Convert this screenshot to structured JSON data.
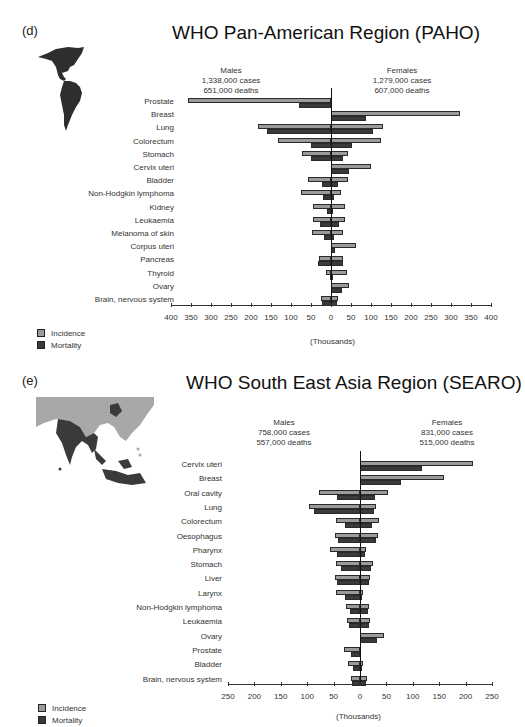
{
  "panels": [
    {
      "letter": "(d)",
      "title": "WHO Pan-American Region (PAHO)",
      "males": {
        "label": "Males",
        "cases": "1,338,000 cases",
        "deaths": "651,000 deaths"
      },
      "females": {
        "label": "Females",
        "cases": "1,279,000 cases",
        "deaths": "607,000 deaths"
      },
      "axis_title": "(Thousands)",
      "tick_labels": [
        "400",
        "350",
        "300",
        "250",
        "200",
        "150",
        "100",
        "50",
        "0",
        "50",
        "100",
        "150",
        "200",
        "250",
        "300",
        "350",
        "400"
      ],
      "legend": {
        "incidence": "Incidence",
        "mortality": "Mortality"
      }
    },
    {
      "letter": "(e)",
      "title": "WHO South East Asia Region (SEARO)",
      "males": {
        "label": "Males",
        "cases": "758,000 cases",
        "deaths": "557,000 deaths"
      },
      "females": {
        "label": "Females",
        "cases": "831,000 cases",
        "deaths": "515,000 deaths"
      },
      "axis_title": "(Thousands)",
      "tick_labels": [
        "250",
        "200",
        "150",
        "100",
        "50",
        "0",
        "50",
        "100",
        "150",
        "200",
        "250"
      ],
      "legend": {
        "incidence": "Incidence",
        "mortality": "Mortality"
      }
    }
  ],
  "colors": {
    "incidence": "#9a9a9a",
    "mortality": "#3a3a3a",
    "axis": "#111111"
  },
  "chart_data": [
    {
      "type": "bar",
      "orientation": "horizontal-butterfly",
      "title": "WHO Pan-American Region (PAHO)",
      "xlabel": "(Thousands)",
      "xlim": [
        -400,
        400
      ],
      "legend": [
        "Incidence",
        "Mortality"
      ],
      "legend_position": "bottom-left",
      "categories": [
        "Prostate",
        "Breast",
        "Lung",
        "Colorectum",
        "Stomach",
        "Cervix uteri",
        "Bladder",
        "Non-Hodgkin lymphoma",
        "Kidney",
        "Leukaemia",
        "Melanoma of skin",
        "Corpus uteri",
        "Pancreas",
        "Thyroid",
        "Ovary",
        "Brain, nervous system"
      ],
      "series": [
        {
          "name": "Males Incidence",
          "values": [
            357,
            0,
            182,
            132,
            72,
            0,
            57,
            75,
            45,
            45,
            48,
            0,
            30,
            12,
            0,
            25
          ]
        },
        {
          "name": "Males Mortality",
          "values": [
            80,
            0,
            160,
            50,
            50,
            0,
            22,
            20,
            10,
            28,
            18,
            0,
            32,
            2,
            0,
            22
          ]
        },
        {
          "name": "Females Incidence",
          "values": [
            0,
            322,
            130,
            125,
            42,
            100,
            42,
            25,
            35,
            35,
            30,
            62,
            30,
            40,
            45,
            18
          ]
        },
        {
          "name": "Females Mortality",
          "values": [
            0,
            88,
            105,
            53,
            30,
            45,
            17,
            8,
            5,
            20,
            8,
            10,
            30,
            3,
            28,
            15
          ]
        }
      ]
    },
    {
      "type": "bar",
      "orientation": "horizontal-butterfly",
      "title": "WHO South East Asia Region (SEARO)",
      "xlabel": "(Thousands)",
      "xlim": [
        -250,
        250
      ],
      "legend": [
        "Incidence",
        "Mortality"
      ],
      "legend_position": "bottom-left",
      "categories": [
        "Cervix uteri",
        "Breast",
        "Oral cavity",
        "Lung",
        "Colorectum",
        "Oesophagus",
        "Pharynx",
        "Stomach",
        "Liver",
        "Larynx",
        "Non-Hodgkin lymphoma",
        "Leukaemia",
        "Ovary",
        "Prostate",
        "Bladder",
        "Brain, nervous system"
      ],
      "series": [
        {
          "name": "Males Incidence",
          "values": [
            0,
            0,
            78,
            97,
            45,
            47,
            57,
            45,
            47,
            45,
            27,
            25,
            0,
            30,
            23,
            17
          ]
        },
        {
          "name": "Males Mortality",
          "values": [
            0,
            0,
            44,
            87,
            28,
            42,
            43,
            36,
            44,
            28,
            19,
            21,
            0,
            17,
            13,
            15
          ]
        },
        {
          "name": "Females Incidence",
          "values": [
            214,
            159,
            53,
            30,
            36,
            34,
            11,
            25,
            19,
            6,
            17,
            19,
            45,
            0,
            6,
            13
          ]
        },
        {
          "name": "Females Mortality",
          "values": [
            117,
            78,
            28,
            27,
            23,
            30,
            9,
            21,
            17,
            4,
            15,
            17,
            32,
            0,
            4,
            11
          ]
        }
      ]
    }
  ]
}
